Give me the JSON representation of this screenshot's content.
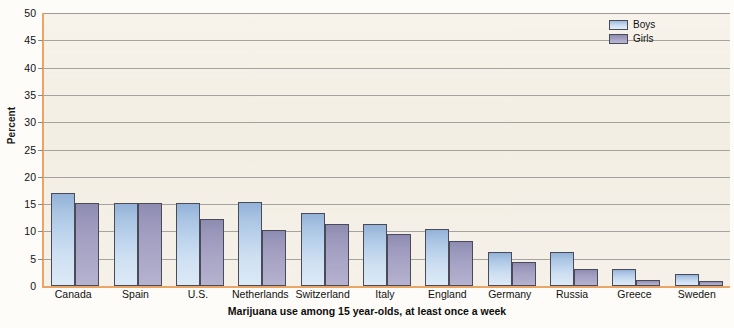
{
  "chart_data": {
    "type": "bar",
    "title": "Marijuana use among 15 year-olds, at least once a week",
    "xlabel": "",
    "ylabel": "Percent",
    "ylim": [
      0,
      50
    ],
    "ytick_step": 5,
    "yticks": [
      0,
      5,
      10,
      15,
      20,
      25,
      30,
      35,
      40,
      45,
      50
    ],
    "grid": true,
    "legend_position": "top-right",
    "categories": [
      "Canada",
      "Spain",
      "U.S.",
      "Netherlands",
      "Switzerland",
      "Italy",
      "England",
      "Germany",
      "Russia",
      "Greece",
      "Sweden"
    ],
    "series": [
      {
        "name": "Boys",
        "color": "#b6d0ea",
        "values": [
          17.0,
          15.2,
          15.2,
          15.3,
          13.4,
          11.4,
          10.4,
          6.3,
          6.2,
          3.1,
          2.2
        ]
      },
      {
        "name": "Girls",
        "color": "#a3a0c2",
        "values": [
          15.2,
          15.2,
          12.3,
          10.3,
          11.3,
          9.5,
          8.3,
          4.4,
          3.2,
          1.1,
          1.0
        ]
      }
    ]
  },
  "axes": {
    "y_title": "Percent",
    "y_tick_labels": [
      "0",
      "5",
      "10",
      "15",
      "20",
      "25",
      "30",
      "35",
      "40",
      "45",
      "50"
    ]
  },
  "legend": {
    "items": [
      {
        "label": "Boys",
        "swatch": "boys"
      },
      {
        "label": "Girls",
        "swatch": "girls"
      }
    ]
  },
  "title": {
    "text": "Marijuana use among 15 year-olds, at least once a week"
  },
  "colors": {
    "plot_background": "#f4efe6",
    "axis_line": "#e8a565",
    "gridline": "#8a8a84",
    "bar_outline": "#4a4a58",
    "boys": "#b6d0ea",
    "girls": "#a3a0c2",
    "text": "#111111"
  }
}
